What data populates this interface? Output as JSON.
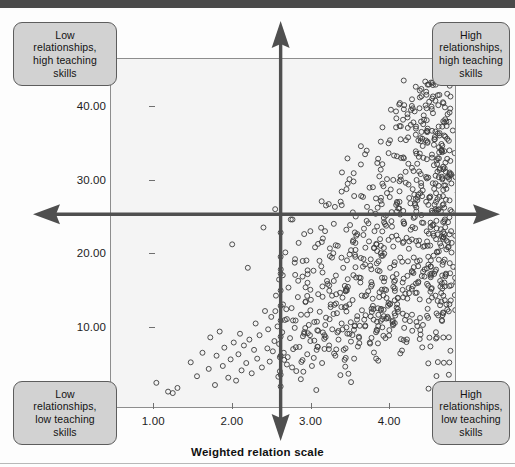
{
  "chart_data": {
    "type": "scatter",
    "title": "",
    "xlabel": "Weighted relation scale",
    "ylabel": "Discursive",
    "xlim": [
      0.45,
      4.85
    ],
    "ylim": [
      -1.0,
      46.5
    ],
    "xticks": [
      "1.00",
      "2.00",
      "3.00",
      "4.00"
    ],
    "xtick_values": [
      1.0,
      2.0,
      3.0,
      4.0
    ],
    "yticks": [
      "10.00",
      "20.00",
      "30.00",
      "40.00"
    ],
    "ytick_values": [
      10.0,
      20.0,
      30.0,
      40.0
    ],
    "grid": false,
    "legend": "none",
    "marker": "open-circle",
    "marker_color": "#3b3b3b",
    "plot_background": "#f4f4f4",
    "reference_lines": {
      "vertical_x": 2.62,
      "horizontal_y": 25.3,
      "style": "double-headed-arrow"
    },
    "annotations": [
      {
        "position": "top-left",
        "text": "Low relationships, high teaching skills"
      },
      {
        "position": "top-right",
        "text": "High relationships, high teaching skills"
      },
      {
        "position": "bottom-left",
        "text": "Low relationships, low teaching skills"
      },
      {
        "position": "bottom-right",
        "text": "High relationships, low teaching skills"
      }
    ],
    "n_points": 900,
    "points": [
      [
        1.03,
        2.3
      ],
      [
        1.18,
        1.1
      ],
      [
        1.3,
        1.6
      ],
      [
        1.24,
        0.9
      ],
      [
        1.47,
        5.1
      ],
      [
        1.55,
        3.2
      ],
      [
        1.62,
        6.4
      ],
      [
        1.7,
        4.2
      ],
      [
        1.72,
        8.5
      ],
      [
        1.78,
        2.0
      ],
      [
        1.8,
        6.0
      ],
      [
        1.84,
        9.3
      ],
      [
        1.88,
        4.6
      ],
      [
        1.9,
        7.1
      ],
      [
        1.95,
        3.0
      ],
      [
        1.98,
        5.5
      ],
      [
        2.0,
        21.2
      ],
      [
        2.02,
        7.8
      ],
      [
        2.05,
        2.6
      ],
      [
        2.08,
        6.2
      ],
      [
        2.1,
        9.0
      ],
      [
        2.12,
        4.0
      ],
      [
        2.15,
        7.4
      ],
      [
        2.18,
        5.0
      ],
      [
        2.2,
        18.0
      ],
      [
        2.22,
        8.2
      ],
      [
        2.25,
        3.6
      ],
      [
        2.28,
        6.8
      ],
      [
        2.3,
        10.4
      ],
      [
        2.32,
        5.6
      ],
      [
        2.35,
        8.8
      ],
      [
        2.38,
        4.4
      ],
      [
        2.4,
        23.5
      ],
      [
        2.42,
        12.1
      ],
      [
        2.45,
        7.0
      ],
      [
        2.46,
        9.6
      ],
      [
        2.48,
        5.2
      ],
      [
        2.5,
        11.3
      ],
      [
        2.52,
        6.6
      ],
      [
        2.54,
        8.0
      ],
      [
        2.55,
        26.0
      ],
      [
        2.56,
        14.2
      ],
      [
        2.58,
        10.0
      ],
      [
        2.6,
        7.6
      ],
      [
        2.6,
        16.4
      ],
      [
        2.61,
        5.8
      ],
      [
        2.62,
        12.8
      ],
      [
        2.62,
        3.4
      ],
      [
        2.62,
        19.5
      ],
      [
        2.62,
        8.6
      ],
      [
        2.62,
        22.8
      ],
      [
        2.62,
        6.0
      ],
      [
        2.62,
        10.8
      ],
      [
        2.62,
        14.9
      ],
      [
        2.62,
        1.8
      ],
      [
        2.62,
        17.2
      ],
      [
        2.64,
        9.2
      ],
      [
        2.65,
        13.0
      ],
      [
        2.66,
        6.4
      ],
      [
        2.68,
        20.1
      ],
      [
        2.7,
        11.0
      ],
      [
        2.7,
        4.8
      ],
      [
        2.72,
        15.3
      ],
      [
        2.74,
        8.4
      ],
      [
        2.75,
        24.6
      ],
      [
        2.76,
        12.5
      ],
      [
        2.78,
        6.9
      ],
      [
        2.8,
        18.7
      ],
      [
        2.8,
        9.8
      ],
      [
        2.82,
        3.9
      ],
      [
        2.84,
        14.0
      ],
      [
        2.85,
        21.4
      ],
      [
        2.86,
        7.2
      ],
      [
        2.88,
        11.6
      ],
      [
        2.9,
        16.8
      ],
      [
        2.9,
        5.4
      ],
      [
        2.92,
        9.0
      ],
      [
        2.94,
        13.4
      ],
      [
        2.95,
        19.0
      ],
      [
        2.96,
        6.2
      ],
      [
        2.98,
        10.2
      ],
      [
        3.0,
        23.0
      ],
      [
        3.0,
        15.0
      ],
      [
        3.0,
        8.0
      ],
      [
        3.0,
        12.2
      ],
      [
        3.02,
        4.6
      ],
      [
        3.04,
        17.6
      ],
      [
        3.05,
        10.6
      ],
      [
        3.06,
        20.8
      ],
      [
        3.08,
        6.8
      ],
      [
        3.1,
        14.4
      ],
      [
        3.1,
        9.4
      ],
      [
        3.12,
        12.0
      ],
      [
        3.14,
        18.2
      ],
      [
        3.15,
        5.0
      ],
      [
        3.16,
        22.0
      ],
      [
        3.18,
        8.8
      ],
      [
        3.2,
        26.5
      ],
      [
        3.2,
        11.2
      ],
      [
        3.22,
        15.8
      ],
      [
        3.24,
        7.4
      ],
      [
        3.25,
        19.6
      ],
      [
        3.26,
        13.0
      ],
      [
        3.28,
        9.6
      ],
      [
        3.3,
        24.0
      ],
      [
        3.3,
        16.2
      ],
      [
        3.32,
        6.0
      ],
      [
        3.34,
        11.8
      ],
      [
        3.35,
        21.0
      ],
      [
        3.36,
        8.2
      ],
      [
        3.38,
        14.6
      ],
      [
        3.4,
        28.4
      ],
      [
        3.4,
        10.4
      ],
      [
        3.42,
        18.0
      ],
      [
        3.44,
        12.6
      ],
      [
        3.45,
        7.0
      ],
      [
        3.46,
        23.2
      ],
      [
        3.48,
        15.4
      ],
      [
        3.5,
        30.1
      ],
      [
        3.5,
        9.0
      ],
      [
        3.52,
        20.4
      ],
      [
        3.54,
        13.6
      ],
      [
        3.55,
        17.0
      ],
      [
        3.56,
        5.6
      ],
      [
        3.58,
        25.0
      ],
      [
        3.6,
        11.4
      ],
      [
        3.6,
        22.6
      ],
      [
        3.62,
        8.6
      ],
      [
        3.64,
        16.0
      ],
      [
        3.65,
        27.8
      ],
      [
        3.66,
        12.2
      ],
      [
        3.68,
        19.2
      ],
      [
        3.7,
        33.5
      ],
      [
        3.7,
        10.0
      ],
      [
        3.72,
        24.4
      ],
      [
        3.74,
        14.8
      ],
      [
        3.75,
        21.6
      ],
      [
        3.76,
        7.8
      ],
      [
        3.78,
        17.8
      ],
      [
        3.8,
        29.0
      ],
      [
        3.8,
        12.8
      ],
      [
        3.82,
        23.0
      ],
      [
        3.84,
        9.2
      ],
      [
        3.85,
        18.6
      ],
      [
        3.86,
        26.2
      ],
      [
        3.88,
        14.0
      ],
      [
        3.9,
        31.4
      ],
      [
        3.9,
        20.0
      ],
      [
        3.92,
        11.0
      ],
      [
        3.94,
        24.8
      ],
      [
        3.95,
        16.6
      ],
      [
        3.96,
        8.4
      ],
      [
        3.98,
        28.2
      ],
      [
        4.0,
        35.0
      ],
      [
        4.0,
        13.2
      ],
      [
        4.0,
        21.8
      ],
      [
        4.02,
        18.0
      ],
      [
        4.04,
        25.6
      ],
      [
        4.05,
        10.6
      ],
      [
        4.06,
        30.0
      ],
      [
        4.08,
        15.2
      ],
      [
        4.1,
        38.4
      ],
      [
        4.1,
        22.4
      ],
      [
        4.12,
        12.0
      ],
      [
        4.14,
        27.0
      ],
      [
        4.15,
        19.4
      ],
      [
        4.16,
        33.0
      ],
      [
        4.18,
        16.0
      ],
      [
        4.2,
        40.2
      ],
      [
        4.2,
        24.0
      ],
      [
        4.2,
        9.8
      ],
      [
        4.22,
        29.6
      ],
      [
        4.24,
        13.8
      ],
      [
        4.25,
        35.8
      ],
      [
        4.26,
        20.6
      ],
      [
        4.28,
        26.8
      ],
      [
        4.3,
        41.0
      ],
      [
        4.3,
        17.4
      ],
      [
        4.3,
        11.6
      ],
      [
        4.32,
        31.2
      ],
      [
        4.34,
        23.4
      ],
      [
        4.35,
        37.0
      ],
      [
        4.36,
        14.6
      ],
      [
        4.38,
        28.0
      ],
      [
        4.4,
        42.2
      ],
      [
        4.4,
        19.0
      ],
      [
        4.4,
        33.6
      ],
      [
        4.42,
        25.2
      ],
      [
        4.44,
        10.2
      ],
      [
        4.45,
        38.8
      ],
      [
        4.46,
        16.8
      ],
      [
        4.48,
        30.4
      ],
      [
        4.5,
        43.0
      ],
      [
        4.5,
        21.0
      ],
      [
        4.5,
        35.2
      ],
      [
        4.5,
        12.4
      ],
      [
        4.52,
        27.6
      ],
      [
        4.54,
        18.2
      ],
      [
        4.55,
        40.0
      ],
      [
        4.56,
        23.8
      ],
      [
        4.58,
        32.0
      ],
      [
        4.6,
        44.0
      ],
      [
        4.6,
        14.2
      ],
      [
        4.6,
        36.6
      ],
      [
        4.6,
        26.0
      ],
      [
        4.62,
        20.2
      ],
      [
        4.64,
        29.2
      ],
      [
        4.65,
        41.6
      ],
      [
        4.66,
        16.2
      ],
      [
        4.68,
        34.0
      ],
      [
        4.7,
        22.2
      ],
      [
        4.7,
        38.0
      ],
      [
        4.7,
        11.8
      ],
      [
        4.7,
        28.6
      ],
      [
        4.7,
        18.8
      ],
      [
        4.7,
        31.8
      ],
      [
        4.72,
        24.6
      ],
      [
        4.74,
        13.0
      ],
      [
        4.75,
        35.6
      ],
      [
        4.76,
        20.8
      ],
      [
        4.78,
        27.2
      ],
      [
        4.8,
        15.6
      ],
      [
        4.8,
        30.8
      ],
      [
        4.8,
        23.0
      ]
    ]
  },
  "axes": {
    "y_title": "Discursive",
    "x_title": "Weighted relation scale"
  },
  "quadrants": {
    "top_left": [
      "Low",
      "relationships,",
      "high teaching",
      "skills"
    ],
    "top_right": [
      "High",
      "relationships,",
      "high teaching",
      "skills"
    ],
    "bottom_left": [
      "Low",
      "relationships,",
      "low teaching",
      "skills"
    ],
    "bottom_right": [
      "High",
      "relationships,",
      "low teaching",
      "skills"
    ]
  },
  "colors": {
    "marker": "#3b3b3b",
    "plot_bg": "#f4f4f4",
    "frame": "#8d8d8d",
    "arrow": "#4f4f4f",
    "box_fill": "#d2d2d2",
    "box_border": "#5d5d5d",
    "scan_bar": "#4a4a4a"
  }
}
